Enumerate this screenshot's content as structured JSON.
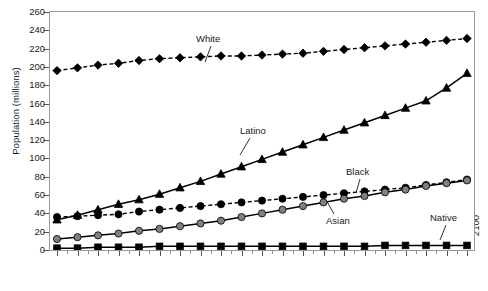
{
  "chart_data": {
    "type": "line",
    "title": "",
    "xlabel": "",
    "ylabel": "Population (millions)",
    "ylim": [
      0,
      260
    ],
    "ytick_step": 20,
    "yticks": [
      0,
      20,
      40,
      60,
      80,
      100,
      120,
      140,
      160,
      180,
      200,
      220,
      240,
      260
    ],
    "grid": false,
    "legend_position": "inline-callouts",
    "x": [
      2000,
      2005,
      2010,
      2015,
      2020,
      2025,
      2030,
      2035,
      2040,
      2045,
      2050,
      2055,
      2060,
      2065,
      2070,
      2075,
      2080,
      2085,
      2090,
      2095,
      2100
    ],
    "categories": [
      "2000",
      "2005",
      "2010",
      "2015",
      "2020",
      "2025",
      "2030",
      "2035",
      "2040",
      "2045",
      "2050",
      "2055",
      "2060",
      "2065",
      "2070",
      "2075",
      "2080",
      "2085",
      "2090",
      "2095",
      "2100"
    ],
    "series": [
      {
        "name": "White",
        "marker": "diamond",
        "linestyle": "dashed",
        "color": "#000000",
        "marker_fill": "#000000",
        "values": [
          196,
          199,
          202,
          204,
          207,
          209,
          210,
          211,
          212,
          212,
          213,
          214,
          215,
          217,
          219,
          221,
          223,
          225,
          227,
          229,
          231
        ]
      },
      {
        "name": "Latino",
        "marker": "triangle",
        "linestyle": "solid",
        "color": "#000000",
        "marker_fill": "#000000",
        "values": [
          33,
          38,
          44,
          50,
          55,
          61,
          68,
          75,
          83,
          91,
          99,
          107,
          115,
          123,
          131,
          139,
          147,
          155,
          163,
          177,
          193
        ]
      },
      {
        "name": "Black",
        "marker": "circle",
        "linestyle": "dashed",
        "color": "#000000",
        "marker_fill": "#000000",
        "values": [
          36,
          37,
          38,
          39,
          42,
          44,
          46,
          48,
          50,
          52,
          54,
          56,
          58,
          60,
          62,
          64,
          66,
          68,
          71,
          74,
          77
        ]
      },
      {
        "name": "Asian",
        "marker": "circle",
        "linestyle": "solid",
        "color": "#000000",
        "marker_fill": "#808080",
        "values": [
          12,
          14,
          16,
          18,
          21,
          23,
          26,
          29,
          32,
          36,
          40,
          44,
          48,
          52,
          56,
          59,
          63,
          66,
          70,
          73,
          76
        ]
      },
      {
        "name": "Native",
        "marker": "square",
        "linestyle": "solid",
        "color": "#000000",
        "marker_fill": "#000000",
        "values": [
          2,
          2,
          3,
          3,
          3,
          4,
          4,
          4,
          4,
          4,
          4,
          4,
          4,
          4,
          4,
          4,
          5,
          5,
          5,
          5,
          5
        ]
      }
    ],
    "callouts": [
      {
        "label": "White",
        "x": 196,
        "y": 34
      },
      {
        "label": "Latino",
        "x": 240,
        "y": 126
      },
      {
        "label": "Black",
        "x": 346,
        "y": 167
      },
      {
        "label": "Asian",
        "x": 326,
        "y": 216
      },
      {
        "label": "Native",
        "x": 430,
        "y": 213
      }
    ]
  },
  "colors": {
    "axis": "#9a9a9a",
    "tick": "#555555",
    "text": "#1a1a1a",
    "series_black": "#000000",
    "series_gray": "#808080",
    "background": "#ffffff"
  }
}
